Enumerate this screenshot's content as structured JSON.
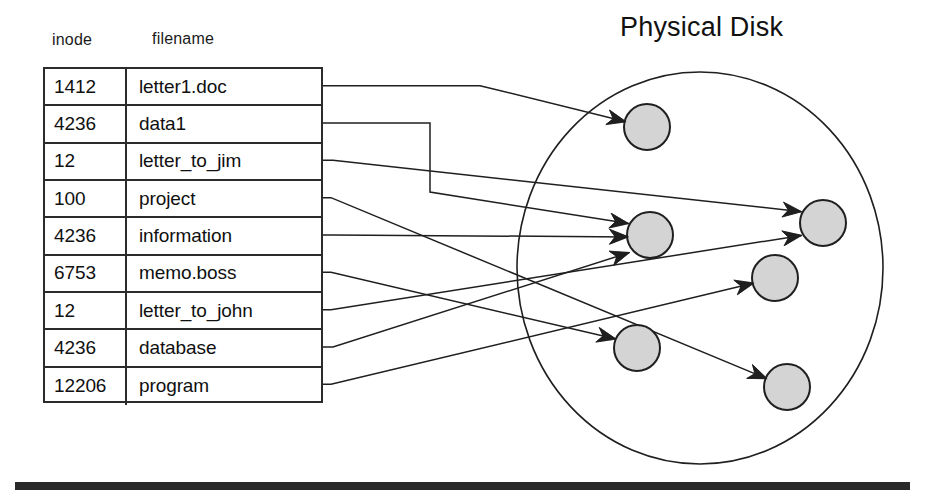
{
  "figure": {
    "title": "Physical Disk",
    "table": {
      "headers": [
        "inode",
        "filename"
      ],
      "rows": [
        {
          "inode": "1412",
          "filename": "letter1.doc"
        },
        {
          "inode": "4236",
          "filename": "data1"
        },
        {
          "inode": "12",
          "filename": "letter_to_jim"
        },
        {
          "inode": "100",
          "filename": "project"
        },
        {
          "inode": "4236",
          "filename": "information"
        },
        {
          "inode": "6753",
          "filename": "memo.boss"
        },
        {
          "inode": "12",
          "filename": "letter_to_john"
        },
        {
          "inode": "4236",
          "filename": "database"
        },
        {
          "inode": "12206",
          "filename": "program"
        }
      ]
    },
    "disk": {
      "ellipse": {
        "cx": 700,
        "cy": 268,
        "rx": 183,
        "ry": 196
      },
      "blocks": [
        {
          "name": "block-a",
          "cx": 647,
          "cy": 127,
          "r": 23
        },
        {
          "name": "block-b",
          "cx": 650,
          "cy": 235,
          "r": 23
        },
        {
          "name": "block-c",
          "cx": 823,
          "cy": 223,
          "r": 23
        },
        {
          "name": "block-d",
          "cx": 775,
          "cy": 278,
          "r": 23
        },
        {
          "name": "block-e",
          "cx": 637,
          "cy": 348,
          "r": 23
        },
        {
          "name": "block-f",
          "cx": 787,
          "cy": 387,
          "r": 23
        }
      ],
      "block_fill": "#d4d4d4",
      "block_stroke": "#1f1f1f"
    },
    "links": [
      {
        "from_row": 0,
        "to_block": "block-a"
      },
      {
        "from_row": 1,
        "to_block": "block-b"
      },
      {
        "from_row": 2,
        "to_block": "block-c"
      },
      {
        "from_row": 3,
        "to_block": "block-f"
      },
      {
        "from_row": 4,
        "to_block": "block-b"
      },
      {
        "from_row": 5,
        "to_block": "block-e"
      },
      {
        "from_row": 6,
        "to_block": "block-c"
      },
      {
        "from_row": 7,
        "to_block": "block-b"
      },
      {
        "from_row": 8,
        "to_block": "block-d"
      }
    ],
    "colors": {
      "ink": "#1f1f1f",
      "block_fill": "#d4d4d4",
      "rule": "#2a2a2a",
      "background": "#ffffff"
    }
  }
}
